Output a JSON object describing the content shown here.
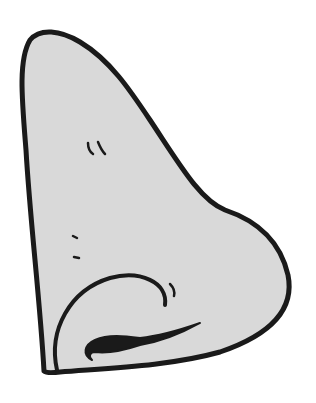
{
  "image": {
    "subject": "cartoon nose illustration",
    "width": 316,
    "height": 403
  },
  "colors": {
    "background": "#ffffff",
    "fill": "#d9d9d9",
    "outline": "#1a1a1a"
  }
}
